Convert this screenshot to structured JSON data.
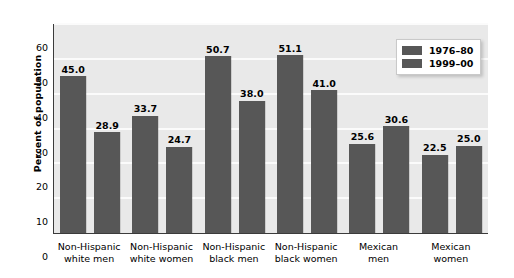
{
  "chart_data": {
    "type": "bar",
    "title": "",
    "subtitle": "",
    "xlabel": "",
    "ylabel": "Percent of population",
    "ylim": [
      0,
      60
    ],
    "ytick_step": 10,
    "yticks": [
      "0",
      "10",
      "20",
      "30",
      "40",
      "50",
      "60"
    ],
    "grid": true,
    "grid_orientation": "horizontal",
    "legend_position": "top-right",
    "bar_color": "#575757",
    "plot_background": "#e9e9e9",
    "gridline_color": "#fbfbfb",
    "axis_color": "#3b3b3b",
    "categories": [
      "Non-Hispanic white men",
      "Non-Hispanic white women",
      "Non-Hispanic black men",
      "Non-Hispanic black women",
      "Mexican men",
      "Mexican women"
    ],
    "category_lines": [
      [
        "Non-Hispanic",
        "white men"
      ],
      [
        "Non-Hispanic",
        "white women"
      ],
      [
        "Non-Hispanic",
        "black men"
      ],
      [
        "Non-Hispanic",
        "black women"
      ],
      [
        "Mexican",
        "men"
      ],
      [
        "Mexican",
        "women"
      ]
    ],
    "series": [
      {
        "name": "1976–80",
        "color": "#575757",
        "values": [
          45.0,
          33.7,
          50.7,
          51.1,
          25.6,
          22.5
        ],
        "labels": [
          "45.0",
          "33.7",
          "50.7",
          "51.1",
          "25.6",
          "22.5"
        ]
      },
      {
        "name": "1999–00",
        "color": "#575757",
        "values": [
          28.9,
          24.7,
          38.0,
          41.0,
          30.6,
          25.0
        ],
        "labels": [
          "28.9",
          "24.7",
          "38.0",
          "41.0",
          "30.6",
          "25.0"
        ]
      }
    ]
  },
  "legend": {
    "entries": [
      {
        "label": "1976–80"
      },
      {
        "label": "1999–00"
      }
    ]
  }
}
